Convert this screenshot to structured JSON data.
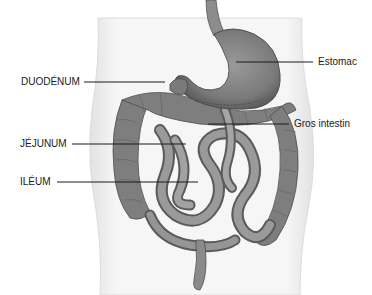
{
  "diagram": {
    "labels": [
      {
        "id": "duodenum",
        "text": "DUODÉNUM",
        "side": "left"
      },
      {
        "id": "jejunum",
        "text": "JÉJUNUM",
        "side": "left"
      },
      {
        "id": "ileum",
        "text": "ILÉUM",
        "side": "left"
      },
      {
        "id": "estomac",
        "text": "Estomac",
        "side": "right"
      },
      {
        "id": "gros-intestin",
        "text": "Gros intestin",
        "side": "right"
      }
    ],
    "colors": {
      "organ_fill": "#8a8a8a",
      "organ_dark": "#5e5e5e",
      "organ_light": "#b4b4b4",
      "torso_fill": "#f3f3f3",
      "torso_edge": "#d8d8d8",
      "leader_line": "#1a1a1a",
      "text": "#1a1a1a"
    }
  }
}
